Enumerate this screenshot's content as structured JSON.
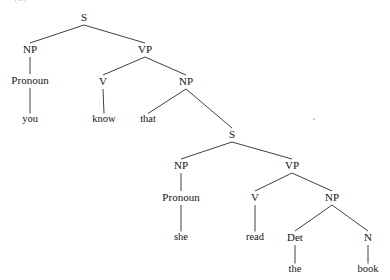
{
  "figure": {
    "background_color": "#ffffff",
    "line_color": "#2b2b2b",
    "text_color": "#141414",
    "width": 390,
    "height": 280,
    "cropped_caption_fragment": "(3)"
  },
  "artifacts": [
    {
      "name": "page-speck",
      "x": 313,
      "y": 118
    }
  ],
  "chart_data": {
    "type": "diagram",
    "subtype": "constituency-syntax-tree",
    "title": "",
    "sentence": "you know that she read the book",
    "terminals": [
      "you",
      "know",
      "that",
      "she",
      "read",
      "the",
      "book"
    ],
    "nodes": [
      {
        "id": "S1",
        "label": "S",
        "kind": "category",
        "x": 84,
        "y": 18,
        "parent": null
      },
      {
        "id": "NP1",
        "label": "NP",
        "kind": "category",
        "x": 30,
        "y": 50,
        "parent": "S1"
      },
      {
        "id": "VP1",
        "label": "VP",
        "kind": "category",
        "x": 145,
        "y": 50,
        "parent": "S1"
      },
      {
        "id": "Pronoun1",
        "label": "Pronoun",
        "kind": "category",
        "x": 30,
        "y": 81,
        "parent": "NP1"
      },
      {
        "id": "you",
        "label": "you",
        "kind": "word",
        "x": 30,
        "y": 120,
        "parent": "Pronoun1"
      },
      {
        "id": "V1",
        "label": "V",
        "kind": "category",
        "x": 103,
        "y": 82,
        "parent": "VP1"
      },
      {
        "id": "NP2",
        "label": "NP",
        "kind": "category",
        "x": 186,
        "y": 82,
        "parent": "VP1"
      },
      {
        "id": "know",
        "label": "know",
        "kind": "word",
        "x": 104,
        "y": 120,
        "parent": "V1"
      },
      {
        "id": "that",
        "label": "that",
        "kind": "word",
        "x": 148,
        "y": 120,
        "parent": "NP2"
      },
      {
        "id": "S2",
        "label": "S",
        "kind": "category",
        "x": 232,
        "y": 135,
        "parent": "NP2"
      },
      {
        "id": "NP3",
        "label": "NP",
        "kind": "category",
        "x": 181,
        "y": 166,
        "parent": "S2"
      },
      {
        "id": "VP2",
        "label": "VP",
        "kind": "category",
        "x": 292,
        "y": 166,
        "parent": "S2"
      },
      {
        "id": "Pronoun2",
        "label": "Pronoun",
        "kind": "category",
        "x": 181,
        "y": 198,
        "parent": "NP3"
      },
      {
        "id": "she",
        "label": "she",
        "kind": "word",
        "x": 181,
        "y": 238,
        "parent": "Pronoun2"
      },
      {
        "id": "V2",
        "label": "V",
        "kind": "category",
        "x": 255,
        "y": 198,
        "parent": "VP2"
      },
      {
        "id": "NP4",
        "label": "NP",
        "kind": "category",
        "x": 332,
        "y": 198,
        "parent": "VP2"
      },
      {
        "id": "read",
        "label": "read",
        "kind": "word",
        "x": 255,
        "y": 238,
        "parent": "V2"
      },
      {
        "id": "Det1",
        "label": "Det",
        "kind": "category",
        "x": 295,
        "y": 238,
        "parent": "NP4"
      },
      {
        "id": "N1",
        "label": "N",
        "kind": "category",
        "x": 368,
        "y": 238,
        "parent": "NP4"
      },
      {
        "id": "the",
        "label": "the",
        "kind": "word",
        "x": 295,
        "y": 270,
        "parent": "Det1"
      },
      {
        "id": "book",
        "label": "book",
        "kind": "word",
        "x": 368,
        "y": 270,
        "parent": "N1"
      }
    ],
    "edges": [
      {
        "from": "S1",
        "to": "NP1"
      },
      {
        "from": "S1",
        "to": "VP1"
      },
      {
        "from": "NP1",
        "to": "Pronoun1"
      },
      {
        "from": "Pronoun1",
        "to": "you"
      },
      {
        "from": "VP1",
        "to": "V1"
      },
      {
        "from": "VP1",
        "to": "NP2"
      },
      {
        "from": "V1",
        "to": "know"
      },
      {
        "from": "NP2",
        "to": "that"
      },
      {
        "from": "NP2",
        "to": "S2"
      },
      {
        "from": "S2",
        "to": "NP3"
      },
      {
        "from": "S2",
        "to": "VP2"
      },
      {
        "from": "NP3",
        "to": "Pronoun2"
      },
      {
        "from": "Pronoun2",
        "to": "she"
      },
      {
        "from": "VP2",
        "to": "V2"
      },
      {
        "from": "VP2",
        "to": "NP4"
      },
      {
        "from": "V2",
        "to": "read"
      },
      {
        "from": "NP4",
        "to": "Det1"
      },
      {
        "from": "NP4",
        "to": "N1"
      },
      {
        "from": "Det1",
        "to": "the"
      },
      {
        "from": "N1",
        "to": "book"
      }
    ]
  }
}
